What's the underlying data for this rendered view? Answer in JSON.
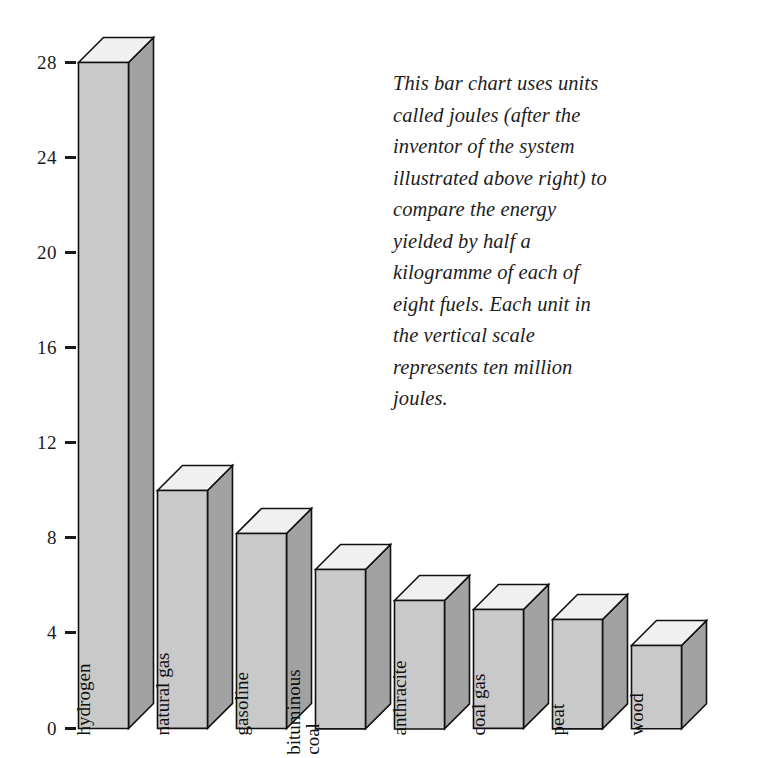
{
  "chart_data": {
    "type": "bar",
    "title": "",
    "xlabel": "",
    "ylabel": "",
    "ylim": [
      0,
      28
    ],
    "grid": false,
    "legend": "none",
    "unit_note": "Each unit in the vertical scale represents ten million joules",
    "categories": [
      "hydrogen",
      "natural gas",
      "gasoline",
      "bituminous coal",
      "anthracite",
      "coal gas",
      "peat",
      "wood"
    ],
    "values": [
      28.0,
      10.0,
      8.2,
      6.7,
      5.4,
      5.0,
      4.6,
      3.5
    ],
    "ytick_labels": [
      "0",
      "4",
      "8",
      "12",
      "16",
      "20",
      "24",
      "28"
    ],
    "ytick_values": [
      0,
      4,
      8,
      12,
      16,
      20,
      24,
      28
    ]
  },
  "caption": {
    "lines": [
      "This bar chart uses units",
      "called joules (after the",
      "inventor of the system",
      "illustrated above right) to",
      "compare the energy",
      "yielded by half a",
      "kilogramme of each of",
      "eight fuels. Each unit in",
      "the vertical scale",
      "represents ten million",
      "joules."
    ]
  },
  "style": {
    "bar_top_color": "#f0f0f0",
    "bar_front_color": "#c9c9c9",
    "bar_side_color": "#a2a2a2",
    "outline_color": "#111111",
    "text_color": "#1a1a1a",
    "background_color": "#ffffff"
  }
}
